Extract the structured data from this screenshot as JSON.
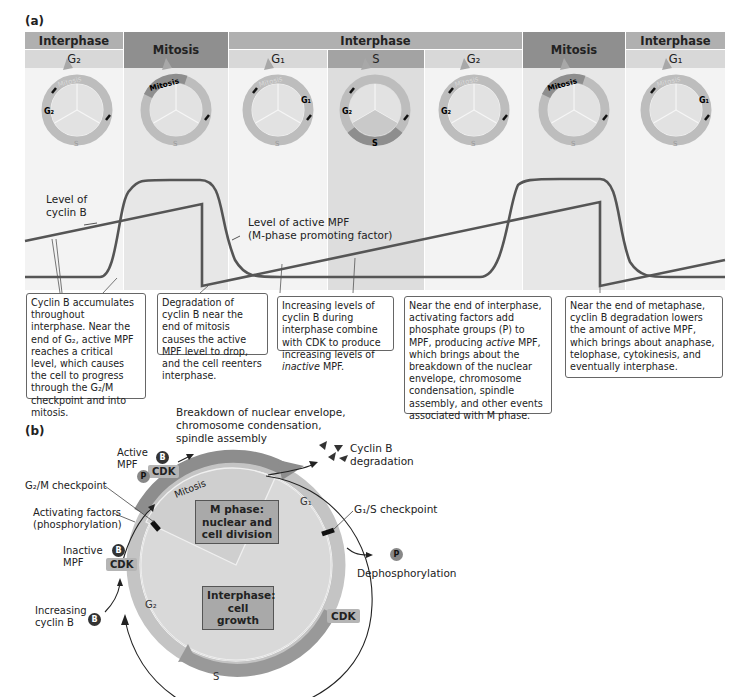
{
  "panel_a": {
    "label": "(a)",
    "header_top": [
      {
        "label": "Interphase",
        "x": 25,
        "w": 98
      },
      {
        "label": "Mitosis",
        "x": 124,
        "w": 104
      },
      {
        "label": "Interphase",
        "x": 229,
        "w": 293
      },
      {
        "label": "Mitosis",
        "x": 523,
        "w": 102
      },
      {
        "label": "Interphase",
        "x": 626,
        "w": 99
      }
    ],
    "header_sub": [
      {
        "label": "G₂",
        "x": 25,
        "w": 98
      },
      {
        "label": "G₁",
        "x": 229,
        "w": 98
      },
      {
        "label": "S",
        "x": 328,
        "w": 96
      },
      {
        "label": "G₂",
        "x": 425,
        "w": 97
      },
      {
        "label": "G₁",
        "x": 626,
        "w": 99
      }
    ],
    "wheels": [
      {
        "highlight": "G₂",
        "mitosis_label": "Mitosis",
        "g1_label": "G₁",
        "s_label": "S",
        "g2_label": "G₂"
      },
      {
        "highlight": "Mitosis",
        "mitosis_label": "Mitosis",
        "g1_label": "G₁",
        "s_label": "S",
        "g2_label": "G₂"
      },
      {
        "highlight": "G₁",
        "mitosis_label": "Mitosis",
        "g1_label": "G₁",
        "s_label": "S",
        "g2_label": "G₂"
      },
      {
        "highlight": "S",
        "mitosis_label": "Mitosis",
        "g1_label": "G₁",
        "s_label": "S",
        "g2_label": "G₂"
      },
      {
        "highlight": "G₂",
        "mitosis_label": "Mitosis",
        "g1_label": "G₁",
        "s_label": "S",
        "g2_label": "G₂"
      },
      {
        "highlight": "Mitosis",
        "mitosis_label": "Mitosis",
        "g1_label": "G₁",
        "s_label": "S",
        "g2_label": "G₂"
      },
      {
        "highlight": "G₁",
        "mitosis_label": "Mitosis",
        "g1_label": "G₁",
        "s_label": "S",
        "g2_label": "G₂"
      }
    ],
    "graph": {
      "cyclin_label_1": "Level of",
      "cyclin_label_2": "cyclin B",
      "mpf_label_1": "Level of active MPF",
      "mpf_label_2": "(M-phase promoting factor)"
    },
    "callouts": [
      {
        "text": "Cyclin B accumulates throughout interphase. Near the end of G₂, active MPF reaches a critical level, which causes the cell to progress through the G₂/M checkpoint and into mitosis."
      },
      {
        "text": "Degradation of cyclin B near the end of mitosis causes the active MPF level to drop, and the cell reenters interphase."
      },
      {
        "text_before": "Increasing levels of cyclin B during interphase combine with CDK to produce increasing levels of ",
        "text_italic": "inactive",
        "text_after": " MPF."
      },
      {
        "text_before": "Near the end of interphase, activating factors add phosphate groups (P) to MPF, producing ",
        "text_italic": "active",
        "text_after": " MPF, which brings about the breakdown of the nuclear envelope, chromosome condensation, spindle assembly, and other events associated with M phase."
      },
      {
        "text": "Near the end of metaphase, cyclin B degradation lowers the amount of active MPF, which brings about anaphase, telophase, cytokinesis, and eventually interphase."
      }
    ]
  },
  "panel_b": {
    "label": "(b)",
    "breakdown_1": "Breakdown of nuclear envelope,",
    "breakdown_2": "chromosome condensation,",
    "breakdown_3": "spindle assembly",
    "cyclin_deg_1": "Cyclin B",
    "cyclin_deg_2": "degradation",
    "active_mpf_1": "Active",
    "active_mpf_2": "MPF",
    "inactive_mpf_1": "Inactive",
    "inactive_mpf_2": "MPF",
    "g2m_checkpoint": "G₂/M checkpoint",
    "activating_1": "Activating factors",
    "activating_2": "(phosphorylation)",
    "increasing_1": "Increasing",
    "increasing_2": "cyclin B",
    "g1s_checkpoint": "G₁/S checkpoint",
    "dephos": "Dephosphorylation",
    "m_phase_1": "M phase:",
    "m_phase_2": "nuclear and",
    "m_phase_3": "cell division",
    "interphase_1": "Interphase:",
    "interphase_2": "cell growth",
    "mitosis_arc": "Mitosis",
    "g1_arc": "G₁",
    "g2_arc": "G₂",
    "s_arc": "S",
    "cdk": "CDK",
    "b_badge": "B",
    "p_badge": "P"
  },
  "colors": {
    "mitosis_dark": "#8f8f8f",
    "interphase_mid": "#b3b3b3",
    "sub_light": "#d6d6d6",
    "s_col": "#a6a6a6",
    "col_bg_light": "#f2f2f2",
    "col_bg_mid": "#e6e6e6",
    "curve": "#555555"
  }
}
